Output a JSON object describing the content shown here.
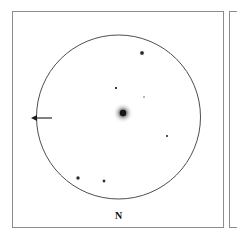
{
  "figure": {
    "kind": "astronomical-finder-chart",
    "background_color": "#ffffff",
    "frame_color": "#8c8c8c",
    "ink_color": "#1a1a1a",
    "width": 237,
    "height": 239
  },
  "panels": {
    "main": {
      "x": 12,
      "y": 11,
      "width": 212,
      "height": 217
    },
    "adjacent": {
      "x": 229,
      "y": 11,
      "width": 14,
      "height": 217
    }
  },
  "field_circle": {
    "label": "field-of-view-circle",
    "cx": 118.5,
    "cy": 117,
    "r": 82,
    "stroke": "#3a3a3a",
    "stroke_width": 0.9
  },
  "orientation": {
    "north_label": "N",
    "north_label_x": 118.5,
    "north_label_y": 216,
    "arrow": {
      "label": "west-direction-arrow",
      "tail_x": 52,
      "tail_y": 118,
      "tip_x": 31,
      "tip_y": 118,
      "head_length": 6,
      "head_half_width": 3.1,
      "stroke": "#1a1a1a",
      "stroke_width": 1.1
    }
  },
  "central_object": {
    "label": "central-fuzzy-object",
    "cx": 123,
    "cy": 113,
    "core_r": 3.2,
    "halo_r": 10.5,
    "color": "#1a1a1a"
  },
  "chart_data": {
    "type": "scatter",
    "title": "",
    "xlabel": "",
    "ylabel": "",
    "projection": "gnomonic-field-of-view",
    "grid": false,
    "legend": null,
    "axis_note": "positions are pixel coordinates within the 237x239 frame; N is toward the bottom, arrow points right-ascension-increasing (west) to the left",
    "series": [
      {
        "name": "field stars",
        "points": [
          {
            "id": "star-ne-bright",
            "x": 142,
            "y": 53,
            "r": 2.5,
            "mag_class": "bright"
          },
          {
            "id": "star-upper-center-faint",
            "x": 116,
            "y": 88,
            "r": 1.3,
            "mag_class": "faint"
          },
          {
            "id": "star-right-of-core-very-faint",
            "x": 144,
            "y": 97,
            "r": 0.95,
            "mag_class": "very-faint"
          },
          {
            "id": "star-east-faint",
            "x": 167,
            "y": 136,
            "r": 1.2,
            "mag_class": "faint"
          },
          {
            "id": "star-sw-medium",
            "x": 78,
            "y": 178,
            "r": 2.2,
            "mag_class": "medium"
          },
          {
            "id": "star-s-medium",
            "x": 104,
            "y": 181,
            "r": 1.9,
            "mag_class": "medium"
          }
        ]
      },
      {
        "name": "target object",
        "points": [
          {
            "id": "target-nebulous",
            "x": 123,
            "y": 113,
            "r": 10.5,
            "mag_class": "extended-fuzzy"
          }
        ]
      }
    ]
  }
}
